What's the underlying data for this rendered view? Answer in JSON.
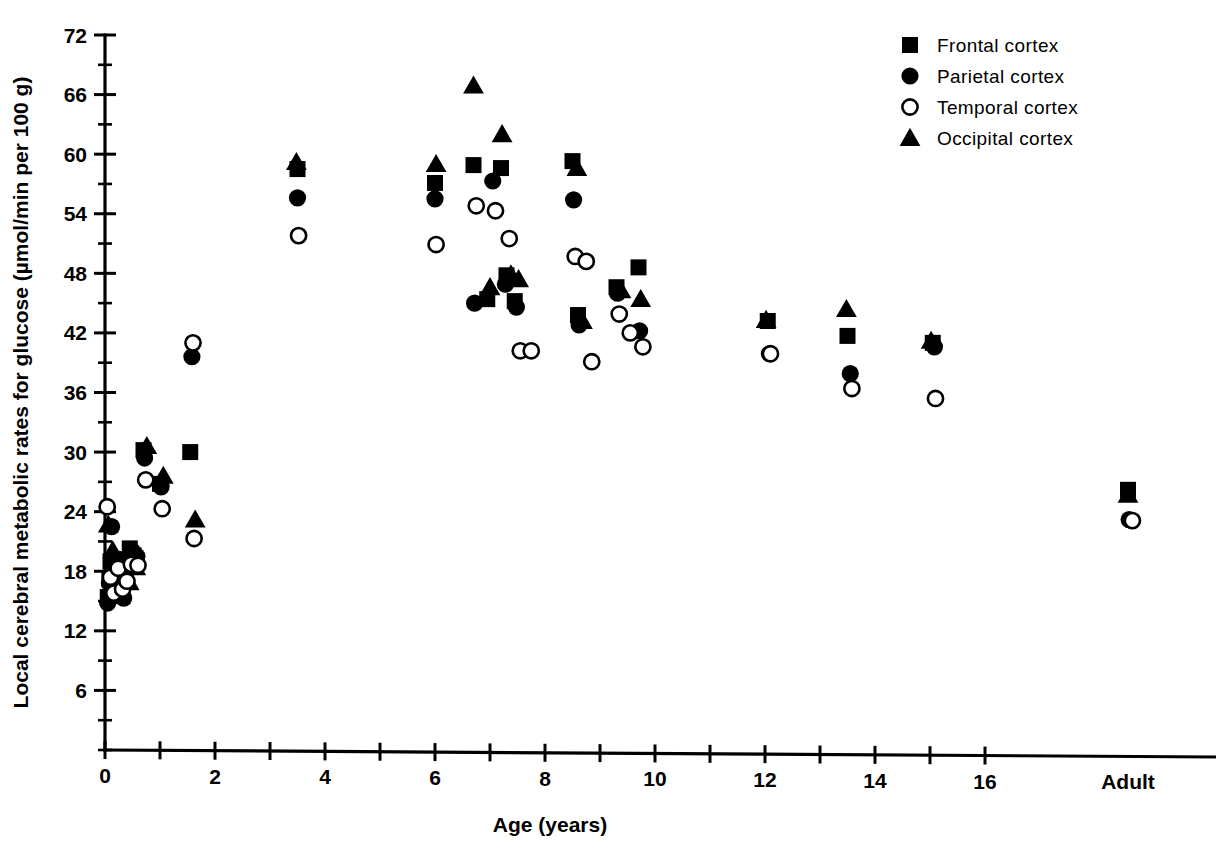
{
  "figure": {
    "background_color": "#ffffff",
    "ink_color": "#000000"
  },
  "axes": {
    "y_label": "Local cerebral metabolic rates for glucose (µmol/min per 100 g)",
    "x_label": "Age (years)",
    "y_ticks": [
      "72",
      "66",
      "60",
      "54",
      "48",
      "42",
      "36",
      "30",
      "24",
      "18",
      "12",
      "6"
    ],
    "x_ticks": [
      "0",
      "2",
      "4",
      "6",
      "8",
      "10",
      "12",
      "14",
      "16"
    ],
    "x_extra_tick": "Adult"
  },
  "legend": {
    "items": [
      {
        "label": "Frontal cortex",
        "marker": "filled-square-icon"
      },
      {
        "label": "Parietal cortex",
        "marker": "filled-circle-icon"
      },
      {
        "label": "Temporal cortex",
        "marker": "open-circle-icon"
      },
      {
        "label": "Occipital cortex",
        "marker": "filled-triangle-icon"
      }
    ]
  },
  "chart_data": {
    "type": "scatter",
    "title": "",
    "xlabel": "Age (years)",
    "ylabel": "Local cerebral metabolic rates for glucose (µmol/min per 100 g)",
    "xlim": [
      0,
      16
    ],
    "ylim": [
      0,
      72
    ],
    "ytick_values": [
      6,
      12,
      18,
      24,
      30,
      36,
      42,
      48,
      54,
      60,
      66,
      72
    ],
    "yminor_step": 3,
    "xtick_values": [
      0,
      1,
      2,
      3,
      4,
      5,
      6,
      7,
      8,
      9,
      10,
      11,
      12,
      13,
      14,
      15,
      16
    ],
    "xtick_labeled": [
      0,
      2,
      4,
      6,
      8,
      10,
      12,
      14,
      16
    ],
    "categorical_x": [
      "Adult"
    ],
    "adult_x": 18.6,
    "grid": false,
    "legend_position": "top-right",
    "series": [
      {
        "name": "Frontal cortex",
        "marker": "filled-square",
        "points": [
          [
            0.05,
            15.4
          ],
          [
            0.08,
            17.3
          ],
          [
            0.1,
            19.0
          ],
          [
            0.18,
            16.0
          ],
          [
            0.22,
            18.6
          ],
          [
            0.3,
            15.6
          ],
          [
            0.38,
            18.9
          ],
          [
            0.45,
            20.3
          ],
          [
            0.52,
            19.6
          ],
          [
            0.7,
            30.2
          ],
          [
            1.0,
            26.8
          ],
          [
            1.55,
            30.0
          ],
          [
            3.5,
            58.5
          ],
          [
            6.0,
            57.1
          ],
          [
            6.7,
            58.9
          ],
          [
            6.95,
            45.4
          ],
          [
            7.2,
            58.6
          ],
          [
            7.3,
            47.8
          ],
          [
            7.45,
            45.2
          ],
          [
            8.5,
            59.3
          ],
          [
            8.6,
            43.8
          ],
          [
            9.3,
            46.6
          ],
          [
            9.7,
            48.6
          ],
          [
            12.05,
            43.2
          ],
          [
            13.5,
            41.7
          ],
          [
            15.05,
            41.0
          ],
          [
            18.6,
            26.2
          ]
        ]
      },
      {
        "name": "Parietal cortex",
        "marker": "filled-circle",
        "points": [
          [
            0.05,
            14.8
          ],
          [
            0.08,
            16.8
          ],
          [
            0.12,
            22.5
          ],
          [
            0.2,
            17.6
          ],
          [
            0.26,
            19.2
          ],
          [
            0.34,
            15.3
          ],
          [
            0.42,
            18.2
          ],
          [
            0.5,
            20.0
          ],
          [
            0.58,
            19.5
          ],
          [
            0.72,
            29.4
          ],
          [
            1.02,
            26.5
          ],
          [
            1.58,
            39.6
          ],
          [
            3.5,
            55.6
          ],
          [
            6.0,
            55.5
          ],
          [
            6.72,
            45.0
          ],
          [
            7.05,
            57.3
          ],
          [
            7.28,
            46.9
          ],
          [
            7.48,
            44.6
          ],
          [
            8.52,
            55.4
          ],
          [
            8.62,
            42.8
          ],
          [
            9.32,
            46.0
          ],
          [
            9.72,
            42.2
          ],
          [
            12.08,
            39.9
          ],
          [
            13.55,
            37.9
          ],
          [
            15.08,
            40.6
          ],
          [
            18.62,
            23.2
          ]
        ]
      },
      {
        "name": "Temporal cortex",
        "marker": "open-circle",
        "points": [
          [
            0.04,
            24.5
          ],
          [
            0.1,
            17.4
          ],
          [
            0.16,
            15.8
          ],
          [
            0.24,
            18.3
          ],
          [
            0.32,
            16.2
          ],
          [
            0.4,
            17.0
          ],
          [
            0.48,
            18.7
          ],
          [
            0.6,
            18.6
          ],
          [
            0.74,
            27.2
          ],
          [
            1.04,
            24.3
          ],
          [
            1.6,
            41.0
          ],
          [
            1.62,
            21.3
          ],
          [
            3.52,
            51.8
          ],
          [
            6.02,
            50.9
          ],
          [
            6.75,
            54.8
          ],
          [
            7.1,
            54.3
          ],
          [
            7.35,
            51.5
          ],
          [
            7.55,
            40.2
          ],
          [
            7.75,
            40.2
          ],
          [
            8.55,
            49.7
          ],
          [
            8.75,
            49.2
          ],
          [
            8.85,
            39.1
          ],
          [
            9.35,
            43.9
          ],
          [
            9.55,
            42.0
          ],
          [
            9.78,
            40.6
          ],
          [
            12.1,
            39.9
          ],
          [
            13.58,
            36.4
          ],
          [
            15.1,
            35.4
          ],
          [
            18.68,
            23.1
          ]
        ]
      },
      {
        "name": "Occipital cortex",
        "marker": "filled-triangle",
        "points": [
          [
            0.06,
            22.7
          ],
          [
            0.14,
            20.1
          ],
          [
            0.22,
            17.2
          ],
          [
            0.28,
            15.5
          ],
          [
            0.36,
            19.1
          ],
          [
            0.44,
            16.9
          ],
          [
            0.56,
            18.4
          ],
          [
            0.76,
            30.6
          ],
          [
            1.06,
            27.6
          ],
          [
            1.64,
            23.2
          ],
          [
            3.48,
            59.2
          ],
          [
            6.02,
            59.0
          ],
          [
            6.7,
            66.9
          ],
          [
            7.0,
            46.6
          ],
          [
            7.22,
            62.0
          ],
          [
            7.38,
            47.9
          ],
          [
            7.52,
            47.4
          ],
          [
            8.58,
            58.6
          ],
          [
            8.68,
            43.2
          ],
          [
            9.38,
            46.3
          ],
          [
            9.74,
            45.4
          ],
          [
            12.02,
            43.3
          ],
          [
            13.48,
            44.4
          ],
          [
            15.02,
            41.2
          ],
          [
            18.6,
            25.7
          ]
        ]
      }
    ]
  }
}
